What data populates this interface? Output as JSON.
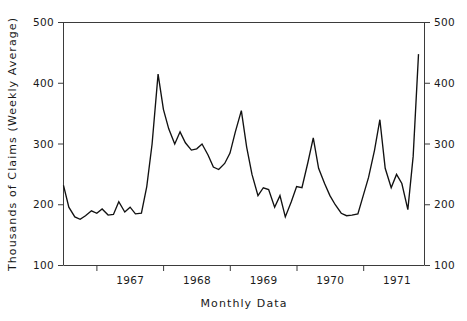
{
  "chart_data": {
    "type": "line",
    "title": "",
    "xlabel": "Monthly Data",
    "ylabel": "Thousands of Claims (Weekly Average)",
    "ylim": [
      100,
      500
    ],
    "ytick_labels": [
      "100",
      "200",
      "300",
      "400",
      "500"
    ],
    "ytick_values": [
      100,
      200,
      300,
      400,
      500
    ],
    "ytick_labels_right": [
      "100",
      "200",
      "300",
      "400",
      "500"
    ],
    "xtick_labels": [
      "1967",
      "1968",
      "1969",
      "1970",
      "1971"
    ],
    "xtick_label_years": [
      1967,
      1968,
      1969,
      1970,
      1971
    ],
    "grid": false,
    "legend": false,
    "left_axis_visible": true,
    "right_axis_visible": true,
    "line_color": "#111111",
    "axis_color": "#3b3b3b",
    "background_color": "#ffffff",
    "x_start_year_fraction": 1966.5,
    "x_end_year_fraction": 1971.92,
    "x": [
      1966.5,
      1966.58,
      1966.67,
      1966.75,
      1966.83,
      1966.92,
      1967.0,
      1967.08,
      1967.17,
      1967.25,
      1967.33,
      1967.42,
      1967.5,
      1967.58,
      1967.67,
      1967.75,
      1967.83,
      1967.92,
      1968.0,
      1968.08,
      1968.17,
      1968.25,
      1968.33,
      1968.42,
      1968.5,
      1968.58,
      1968.67,
      1968.75,
      1968.83,
      1968.92,
      1969.0,
      1969.08,
      1969.17,
      1969.25,
      1969.33,
      1969.42,
      1969.5,
      1969.58,
      1969.67,
      1969.75,
      1969.83,
      1969.92,
      1970.0,
      1970.08,
      1970.17,
      1970.25,
      1970.33,
      1970.42,
      1970.5,
      1970.58,
      1970.67,
      1970.75,
      1970.83,
      1970.92,
      1971.0,
      1971.08,
      1971.17,
      1971.25,
      1971.33,
      1971.42,
      1971.5,
      1971.58,
      1971.67,
      1971.75,
      1971.83
    ],
    "values": [
      232,
      196,
      180,
      176,
      182,
      190,
      186,
      193,
      183,
      184,
      205,
      188,
      196,
      185,
      186,
      230,
      300,
      415,
      357,
      325,
      300,
      320,
      302,
      290,
      292,
      300,
      282,
      262,
      258,
      268,
      285,
      320,
      355,
      295,
      250,
      215,
      228,
      225,
      196,
      215,
      180,
      205,
      230,
      228,
      270,
      310,
      260,
      235,
      215,
      200,
      186,
      182,
      183,
      185,
      215,
      245,
      290,
      340,
      260,
      228,
      250,
      235,
      192,
      280,
      448
    ],
    "peaks": [
      {
        "label": "peak-1968",
        "value": 415
      },
      {
        "label": "peak-1969",
        "value": 355
      },
      {
        "label": "peak-1971-end",
        "value": 448
      }
    ]
  },
  "axes": {
    "y_left_title": "Thousands of Claims (Weekly Average)",
    "x_title": "Monthly Data"
  }
}
